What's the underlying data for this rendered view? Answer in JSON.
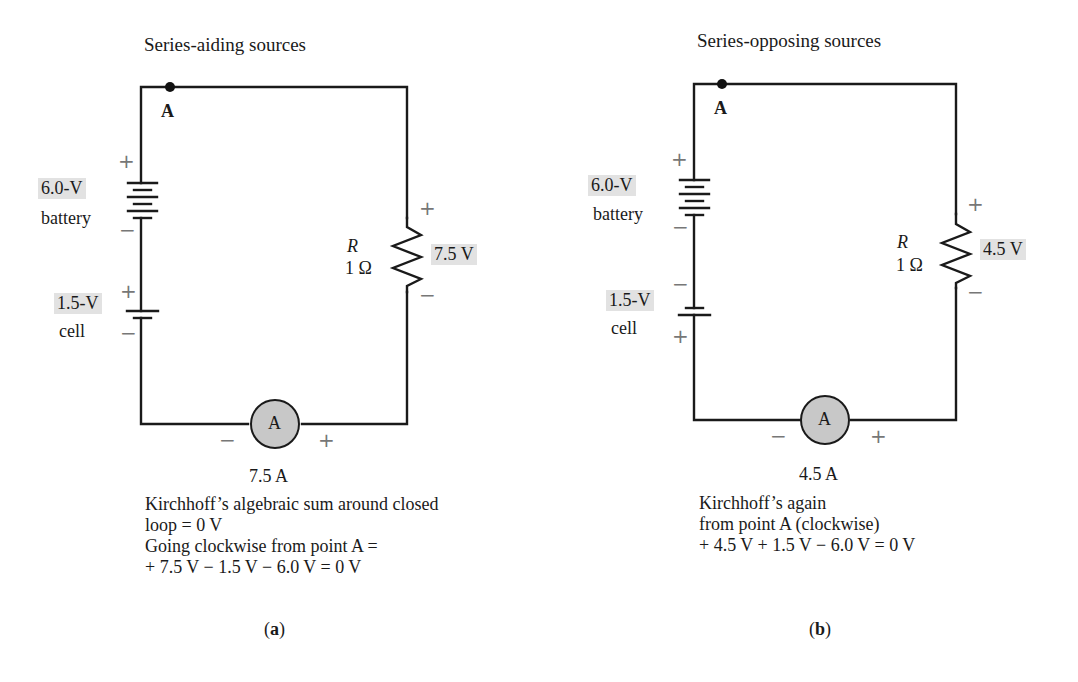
{
  "figure": {
    "panel_a": {
      "title": "Series-aiding sources",
      "node_label": "A",
      "battery": {
        "value": "6.0-V",
        "name": "battery",
        "plus": "+",
        "minus": "−"
      },
      "cell": {
        "value": "1.5-V",
        "name": "cell",
        "plus": "+",
        "minus": "−"
      },
      "resistor": {
        "symbol": "R",
        "value": "1 Ω",
        "voltage": "7.5 V",
        "plus": "+",
        "minus": "−"
      },
      "ammeter": {
        "symbol": "A",
        "reading": "7.5 A",
        "minus": "−",
        "plus": "+"
      },
      "caption_lines": [
        "Kirchhoff’s algebraic sum around closed",
        "loop = 0 V",
        "Going clockwise from point A =",
        "+ 7.5 V − 1.5 V − 6.0 V = 0 V"
      ],
      "label": "(a)",
      "label_letter": "a"
    },
    "panel_b": {
      "title": "Series-opposing sources",
      "node_label": "A",
      "battery": {
        "value": "6.0-V",
        "name": "battery",
        "plus": "+",
        "minus": "−"
      },
      "cell": {
        "value": "1.5-V",
        "name": "cell",
        "plus": "+",
        "minus": "−"
      },
      "resistor": {
        "symbol": "R",
        "value": "1 Ω",
        "voltage": "4.5 V",
        "plus": "+",
        "minus": "−"
      },
      "ammeter": {
        "symbol": "A",
        "reading": "4.5 A",
        "minus": "−",
        "plus": "+"
      },
      "caption_lines": [
        "Kirchhoff’s again",
        "from point A (clockwise)",
        "+ 4.5 V + 1.5 V − 6.0 V = 0 V"
      ],
      "label": "(b)",
      "label_letter": "b"
    },
    "colors": {
      "wire": "#1a1a1a",
      "label_highlight": "#e2e2e2",
      "ammeter_fill": "#c8c8c8",
      "polarity_sign": "#777777"
    }
  }
}
